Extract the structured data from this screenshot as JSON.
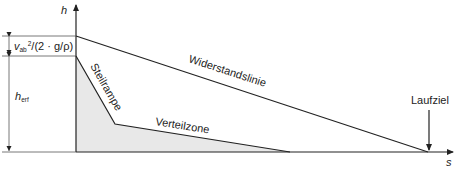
{
  "diagram": {
    "axes": {
      "y_label": "h",
      "x_label": "s"
    },
    "dimensions": {
      "upper": {
        "formula_prefix": "v",
        "formula_subscript": "ab",
        "formula_superscript": "2",
        "formula_rest": "/(2 · g/ρ)"
      },
      "lower": {
        "symbol": "h",
        "subscript": "erf"
      }
    },
    "labels": {
      "resistance_line": "Widerstandslinie",
      "steep_ramp": "Steilrampe",
      "distribution_zone": "Verteilzone",
      "target": "Laufziel"
    },
    "colors": {
      "line": "#222222",
      "fill": "#e8e8e8",
      "background": "#ffffff"
    }
  }
}
